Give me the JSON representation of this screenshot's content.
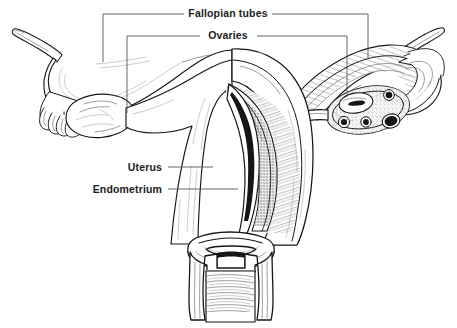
{
  "figure": {
    "style": "pen-and-ink anatomical line drawing, anterior view, right half shown in cross-section",
    "background_color": "#ffffff",
    "ink_color": "#15161a",
    "leader_line_color": "#555555",
    "label_text_color": "#1c1c1c"
  },
  "labels": [
    {
      "id": "fallopian-tubes",
      "text": "Fallopian tubes",
      "text_x": 228,
      "text_y": 17,
      "leader_style": "bracket",
      "bracket": {
        "left_dash_x1": 103,
        "left_dash_x2": 184,
        "right_dash_x1": 272,
        "right_dash_x2": 368,
        "y": 14,
        "left_drop_x": 103,
        "left_drop_y": 62,
        "right_drop_x": 368,
        "right_drop_y": 58
      }
    },
    {
      "id": "ovaries",
      "text": "Ovaries",
      "text_x": 228,
      "text_y": 39,
      "leader_style": "bracket",
      "bracket": {
        "left_dash_x1": 127,
        "left_dash_x2": 200,
        "right_dash_x1": 257,
        "right_dash_x2": 347,
        "y": 36,
        "left_drop_x": 127,
        "left_drop_y": 113,
        "right_drop_x": 347,
        "right_drop_y": 97
      }
    },
    {
      "id": "uterus",
      "text": "Uterus",
      "text_x": 162,
      "text_y": 171,
      "text_anchor": "end",
      "leader_style": "horizontal",
      "line": {
        "x1": 168,
        "y1": 167,
        "x2": 213,
        "y2": 167
      }
    },
    {
      "id": "endometrium",
      "text": "Endometrium",
      "text_x": 162,
      "text_y": 193,
      "text_anchor": "end",
      "leader_style": "horizontal",
      "line": {
        "x1": 168,
        "y1": 189,
        "x2": 238,
        "y2": 189
      }
    }
  ],
  "anatomy_parts": [
    {
      "id": "left-fallopian-tube",
      "name": "Left fallopian tube",
      "side": "left",
      "rendering": "outline"
    },
    {
      "id": "left-fimbriae",
      "name": "Left fimbriae",
      "side": "left",
      "rendering": "outline"
    },
    {
      "id": "left-ovary",
      "name": "Left ovary",
      "side": "left",
      "rendering": "outline"
    },
    {
      "id": "left-suspensory-ligament",
      "name": "Left suspensory ligament stub",
      "side": "left",
      "rendering": "outline"
    },
    {
      "id": "right-fallopian-tube",
      "name": "Right fallopian tube",
      "side": "right",
      "rendering": "cross-section"
    },
    {
      "id": "right-fimbriae",
      "name": "Right fimbriae",
      "side": "right",
      "rendering": "cross-section"
    },
    {
      "id": "right-ovary",
      "name": "Right ovary with follicles",
      "side": "right",
      "rendering": "cross-section"
    },
    {
      "id": "right-suspensory-ligament",
      "name": "Right suspensory ligament stub",
      "side": "right",
      "rendering": "outline"
    },
    {
      "id": "uterus-body",
      "name": "Uterus body (myometrium)",
      "side": "center",
      "rendering": "half-section"
    },
    {
      "id": "endometrium-lining",
      "name": "Endometrium",
      "side": "center",
      "rendering": "stippled"
    },
    {
      "id": "uterine-cavity",
      "name": "Uterine cavity",
      "side": "center",
      "rendering": "cross-section"
    },
    {
      "id": "cervix",
      "name": "Cervix",
      "side": "center",
      "rendering": "cross-section"
    },
    {
      "id": "vagina",
      "name": "Vagina with rugae",
      "side": "center",
      "rendering": "cross-section"
    }
  ]
}
